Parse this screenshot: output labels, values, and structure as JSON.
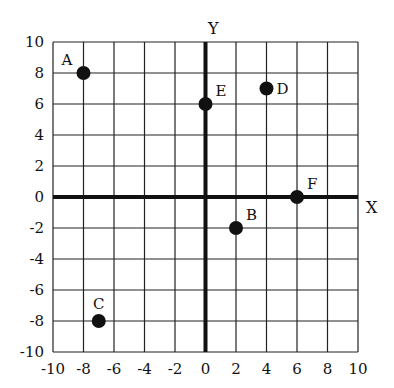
{
  "chart_data": {
    "type": "scatter",
    "title": "",
    "xlabel": "X",
    "ylabel": "Y",
    "xlim": [
      -10,
      10
    ],
    "ylim": [
      -10,
      10
    ],
    "grid": true,
    "x_ticks": [
      -10,
      -8,
      -6,
      -4,
      -2,
      0,
      2,
      4,
      6,
      8,
      10
    ],
    "y_ticks": [
      -10,
      -8,
      -6,
      -4,
      -2,
      0,
      2,
      4,
      6,
      8,
      10
    ],
    "points": [
      {
        "label": "A",
        "x": -8,
        "y": 8,
        "label_pos": "upper-left"
      },
      {
        "label": "B",
        "x": 2,
        "y": -2,
        "label_pos": "upper-right"
      },
      {
        "label": "C",
        "x": -7,
        "y": -8,
        "label_pos": "above"
      },
      {
        "label": "D",
        "x": 4,
        "y": 7,
        "label_pos": "right"
      },
      {
        "label": "E",
        "x": 0,
        "y": 6,
        "label_pos": "upper-right"
      },
      {
        "label": "F",
        "x": 6,
        "y": 0,
        "label_pos": "upper-right"
      }
    ],
    "colors": {
      "point": "#111111",
      "grid": "#222222",
      "axis": "#111111"
    }
  }
}
